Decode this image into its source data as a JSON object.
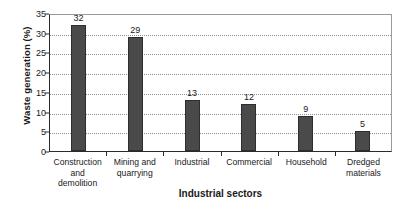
{
  "chart_data": {
    "type": "bar",
    "title": "",
    "xlabel": "Industrial sectors",
    "ylabel": "Waste generation (%)",
    "categories": [
      "Construction and demolition",
      "Mining and quarrying",
      "Industrial",
      "Commercial",
      "Household",
      "Dredged materials"
    ],
    "category_lines": [
      [
        "Construction",
        "and demolition"
      ],
      [
        "Mining and",
        "quarrying"
      ],
      [
        "Industrial",
        ""
      ],
      [
        "Commercial",
        ""
      ],
      [
        "Household",
        ""
      ],
      [
        "Dredged",
        "materials"
      ]
    ],
    "values": [
      32,
      29,
      13,
      12,
      9,
      5
    ],
    "data_labels": [
      "32",
      "29",
      "13",
      "12",
      "9",
      "5"
    ],
    "ylim": [
      0,
      35
    ],
    "ytick_step": 5,
    "yticks": [
      "0",
      "5",
      "10",
      "15",
      "20",
      "25",
      "30",
      "35"
    ],
    "grid": true,
    "grid_style": "dotted-horizontal",
    "legend": "none",
    "series_name": "Waste generation",
    "bar_color": "#4a4a4a",
    "bar_edge_color": "#2e2e2e",
    "axis_color": "#2b2b2b",
    "grid_color": "#8d8d8d",
    "plot_border_color": "#9a9a9a",
    "background": "#ffffff"
  }
}
